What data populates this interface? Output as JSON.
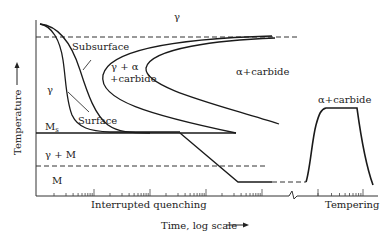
{
  "diagram": {
    "type": "TTT diagram - martempering (interrupted quenching) and tempering",
    "axes": {
      "y_label": "Temperature",
      "x_label": "Time, log scale",
      "x_sections": [
        "Interrupted quenching",
        "Tempering"
      ]
    },
    "regions": {
      "austenite_top": "γ",
      "austenite_left": "γ",
      "transforming": "γ + α\n+carbide",
      "transforming_line1": "γ + α",
      "transforming_line2": "+carbide",
      "product": "α+carbide",
      "tempering_product": "α+carbide",
      "ms_label": "M",
      "ms_subscript": "s",
      "gamma_plus_m": "γ + M",
      "martensite": "M"
    },
    "curve_labels": {
      "subsurface": "Subsurface",
      "surface": "Surface"
    },
    "colors": {
      "line": "#1a1a1a",
      "background": "#ffffff"
    }
  }
}
